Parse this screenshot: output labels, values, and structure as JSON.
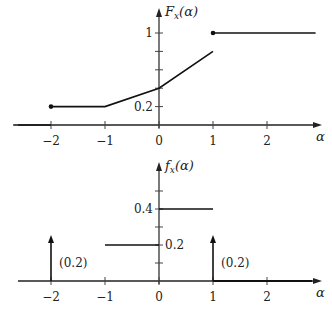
{
  "chart_data": [
    {
      "type": "line",
      "title": "",
      "ylabel_main": "F",
      "ylabel_sub": "x",
      "ylabel_arg": "(α)",
      "xlabel": "α",
      "xlim": [
        -2.7,
        2.9
      ],
      "ylim": [
        0,
        1.15
      ],
      "x_ticks": [
        -2,
        -1,
        0,
        1,
        2
      ],
      "x_tick_labels": [
        "−2",
        "−1",
        "0",
        "1",
        "2"
      ],
      "y_ticks": [
        0.2,
        0.4,
        0.6,
        0.8,
        1
      ],
      "y_tick_labels": {
        "0.2": "0.2",
        "1": "1"
      },
      "segments": [
        {
          "points": [
            [
              -2,
              0.2
            ],
            [
              -1,
              0.2
            ],
            [
              0,
              0.4
            ],
            [
              1,
              0.8
            ]
          ]
        },
        {
          "points": [
            [
              1,
              1
            ],
            [
              2.9,
              1
            ]
          ]
        },
        {
          "points": [
            [
              -2.7,
              0
            ],
            [
              -2,
              0
            ]
          ]
        }
      ],
      "dots": [
        [
          -2,
          0.2
        ],
        [
          1,
          1
        ]
      ]
    },
    {
      "type": "line",
      "title": "",
      "ylabel_main": "f",
      "ylabel_sub": "x",
      "ylabel_arg": "(α)",
      "xlabel": "α",
      "xlim": [
        -2.7,
        2.9
      ],
      "ylim": [
        0,
        0.58
      ],
      "x_ticks": [
        -2,
        -1,
        0,
        1,
        2
      ],
      "x_tick_labels": [
        "−2",
        "−1",
        "0",
        "1",
        "2"
      ],
      "y_ticks": [
        0.1,
        0.2,
        0.3,
        0.4,
        0.5
      ],
      "y_tick_labels": {
        "0.2": "0.2",
        "0.4": "0.4"
      },
      "segments": [
        {
          "points": [
            [
              -1,
              0.2
            ],
            [
              0,
              0.2
            ]
          ]
        },
        {
          "points": [
            [
              0,
              0.4
            ],
            [
              1,
              0.4
            ]
          ]
        }
      ],
      "impulses": [
        {
          "x": -2,
          "weight": 0.2,
          "label": "(0.2)"
        },
        {
          "x": 1,
          "weight": 0.2,
          "label": "(0.2)"
        }
      ]
    }
  ]
}
